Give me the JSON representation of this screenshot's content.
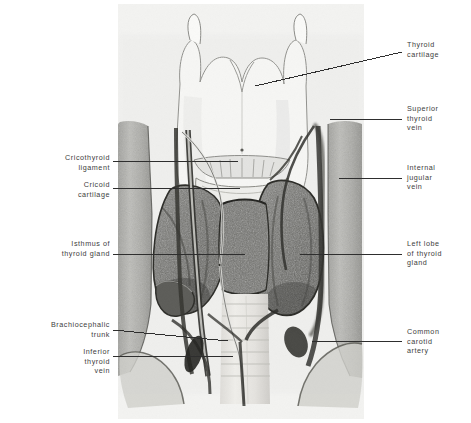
{
  "figure": {
    "background_color": "#ffffff",
    "plate_color": "#f2f2f0",
    "ink_color": "#2e2e2e",
    "label_color": "#3d3d3d"
  },
  "labels": {
    "right": [
      {
        "id": "thyroid-cartilage",
        "text": "Thyroid\ncartilage",
        "x": 407,
        "y": 40,
        "leader": {
          "x1": 255,
          "y1": 86,
          "x2": 402,
          "y2": 52
        }
      },
      {
        "id": "superior-thyroid-vein",
        "text": "Superior\nthyroid\nvein",
        "x": 407,
        "y": 104,
        "leader": {
          "x1": 330,
          "y1": 119,
          "x2": 402,
          "y2": 119
        }
      },
      {
        "id": "internal-jugular-vein",
        "text": "Internal\njugular\nvein",
        "x": 407,
        "y": 163,
        "leader": {
          "x1": 339,
          "y1": 178,
          "x2": 402,
          "y2": 178
        }
      },
      {
        "id": "left-lobe-of-thyroid-gland",
        "text": "Left lobe\nof thyroid\ngland",
        "x": 407,
        "y": 239,
        "leader": {
          "x1": 300,
          "y1": 254,
          "x2": 402,
          "y2": 254
        }
      },
      {
        "id": "common-carotid-artery",
        "text": "Common\ncarotid\nartery",
        "x": 407,
        "y": 327,
        "leader": {
          "x1": 312,
          "y1": 341,
          "x2": 402,
          "y2": 341
        }
      }
    ],
    "left": [
      {
        "id": "cricothyroid-ligament",
        "text": "Cricothyroid\nligament",
        "x": 22,
        "y": 153,
        "right": 110,
        "leader": {
          "x1": 113,
          "y1": 161,
          "x2": 238,
          "y2": 161
        }
      },
      {
        "id": "cricoid-cartilage",
        "text": "Cricoid\ncartilage",
        "x": 22,
        "y": 180,
        "right": 110,
        "leader": {
          "x1": 113,
          "y1": 188,
          "x2": 240,
          "y2": 188
        }
      },
      {
        "id": "isthmus-of-thyroid-gland",
        "text": "Isthmus of\nthyroid gland",
        "x": 22,
        "y": 239,
        "right": 110,
        "leader": {
          "x1": 113,
          "y1": 254,
          "x2": 245,
          "y2": 254
        }
      },
      {
        "id": "brachiocephalic-trunk",
        "text": "Brachiocephalic\ntrunk",
        "x": 10,
        "y": 320,
        "right": 110,
        "leader": {
          "x1": 113,
          "y1": 330,
          "x2": 228,
          "y2": 341
        }
      },
      {
        "id": "inferior-thyroid-vein",
        "text": "Inferior\nthyroid\nvein",
        "x": 22,
        "y": 347,
        "right": 110,
        "leader": {
          "x1": 113,
          "y1": 356,
          "x2": 233,
          "y2": 356
        }
      }
    ]
  },
  "structures": [
    {
      "name": "thyroid-cartilage",
      "tone": "light-outline"
    },
    {
      "name": "superior-horn-left",
      "tone": "light-outline"
    },
    {
      "name": "superior-horn-right",
      "tone": "light-outline"
    },
    {
      "name": "cricothyroid-ligament",
      "tone": "light"
    },
    {
      "name": "cricoid-cartilage",
      "tone": "light"
    },
    {
      "name": "thyroid-gland-right-lobe",
      "tone": "dark-mottled"
    },
    {
      "name": "thyroid-gland-left-lobe",
      "tone": "dark-mottled"
    },
    {
      "name": "thyroid-gland-isthmus",
      "tone": "dark-mottled"
    },
    {
      "name": "trachea",
      "tone": "light-banded"
    },
    {
      "name": "common-carotid-artery",
      "tone": "mid"
    },
    {
      "name": "internal-jugular-vein",
      "tone": "mid"
    },
    {
      "name": "superior-thyroid-vein",
      "tone": "line"
    },
    {
      "name": "inferior-thyroid-vein",
      "tone": "line"
    },
    {
      "name": "brachiocephalic-trunk",
      "tone": "mid"
    },
    {
      "name": "sternocleidomastoid-left",
      "tone": "mid"
    },
    {
      "name": "sternocleidomastoid-right",
      "tone": "mid"
    },
    {
      "name": "clavicle-left",
      "tone": "light"
    },
    {
      "name": "clavicle-right",
      "tone": "light"
    }
  ]
}
